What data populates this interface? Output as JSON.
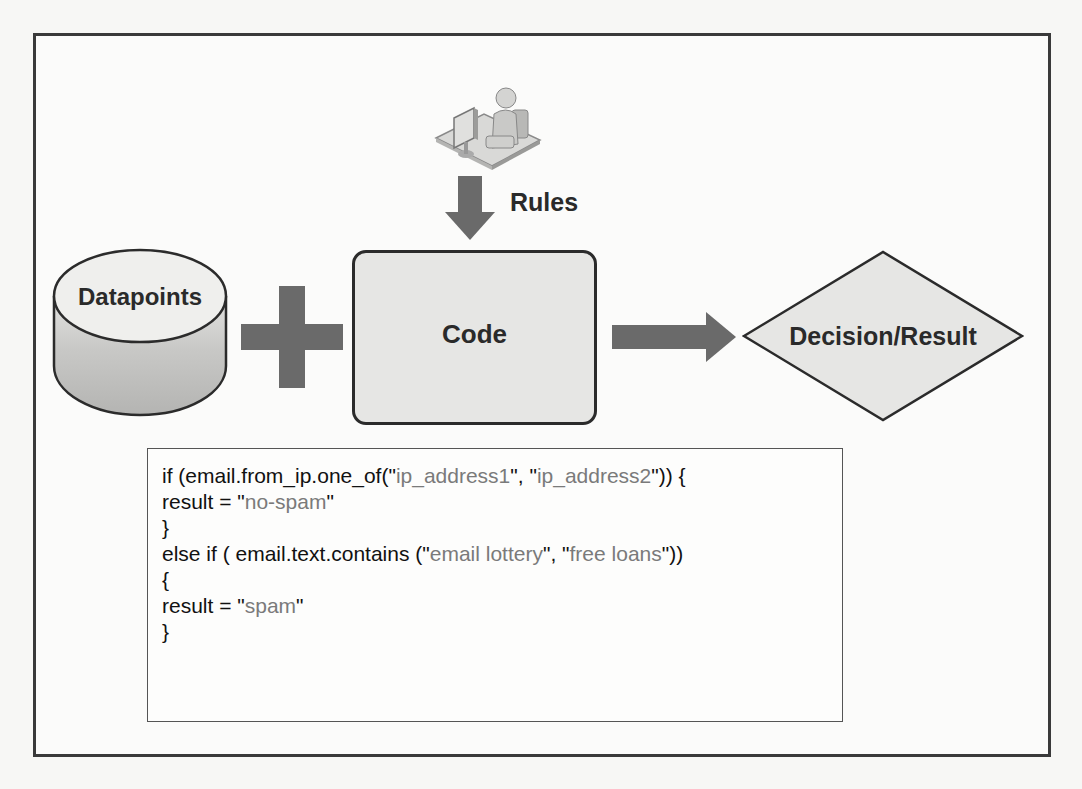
{
  "diagram": {
    "title": "",
    "nodes": {
      "user": {
        "icon": "user-at-computer-icon"
      },
      "rules_label": "Rules",
      "datapoints": {
        "label": "Datapoints",
        "shape": "cylinder"
      },
      "plus": {
        "icon": "plus-icon"
      },
      "code": {
        "label": "Code",
        "shape": "rounded-rectangle"
      },
      "decision": {
        "label": "Decision/Result",
        "shape": "diamond"
      }
    },
    "edges": [
      {
        "from": "user",
        "to": "code",
        "label": "Rules",
        "direction": "down"
      },
      {
        "from": "code",
        "to": "decision",
        "label": "",
        "direction": "right"
      }
    ],
    "code_snippet": {
      "lines": [
        {
          "parts": [
            {
              "t": "if (email.from_ip.one_of(\"",
              "s": false
            },
            {
              "t": "ip_address1",
              "s": true
            },
            {
              "t": "\", \"",
              "s": false
            },
            {
              "t": "ip_address2",
              "s": true
            },
            {
              "t": "\")) {",
              "s": false
            }
          ]
        },
        {
          "parts": [
            {
              "t": "result = \"",
              "s": false
            },
            {
              "t": "no-spam",
              "s": true
            },
            {
              "t": "\"",
              "s": false
            }
          ]
        },
        {
          "parts": [
            {
              "t": "}",
              "s": false
            }
          ]
        },
        {
          "parts": [
            {
              "t": "else if ( email.text.contains (\"",
              "s": false
            },
            {
              "t": "email lottery",
              "s": true
            },
            {
              "t": "\", \"",
              "s": false
            },
            {
              "t": "free loans",
              "s": true
            },
            {
              "t": "\"))",
              "s": false
            }
          ]
        },
        {
          "parts": [
            {
              "t": "{",
              "s": false
            }
          ]
        },
        {
          "parts": [
            {
              "t": "result = \"",
              "s": false
            },
            {
              "t": "spam",
              "s": true
            },
            {
              "t": "\"",
              "s": false
            }
          ]
        },
        {
          "parts": [
            {
              "t": "}",
              "s": false
            }
          ]
        }
      ]
    },
    "colors": {
      "arrow": "#6a6a6a",
      "shape_fill": "#e6e6e4",
      "shape_stroke": "#2b2b2b",
      "string_text": "#7a7a7a",
      "frame": "#3a3a3a"
    }
  }
}
